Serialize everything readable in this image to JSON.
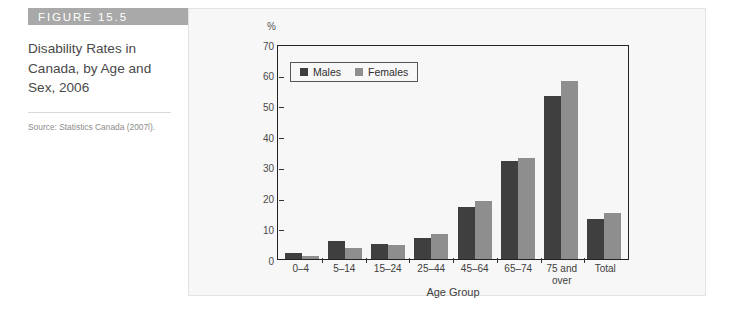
{
  "figure": {
    "band_label": "FIGURE 15.5",
    "title": "Disability Rates in Canada, by Age and Sex, 2006",
    "source": "Source: Statistics Canada (2007l).",
    "band_color": "#a9a9a9"
  },
  "chart_data": {
    "type": "bar",
    "title": "",
    "xlabel": "Age Group",
    "ylabel": "%",
    "ylim": [
      0,
      70
    ],
    "yticks": [
      0,
      10,
      20,
      30,
      40,
      50,
      60,
      70
    ],
    "grid": false,
    "legend_position": "top-left-inside",
    "categories": [
      "0–4",
      "5–14",
      "15–24",
      "25–44",
      "45–64",
      "65–74",
      "75 and over",
      "Total"
    ],
    "series": [
      {
        "name": "Males",
        "color": "#3f3f3f",
        "values": [
          2,
          6,
          5,
          7,
          17,
          32,
          53,
          13
        ]
      },
      {
        "name": "Females",
        "color": "#8e8e8e",
        "values": [
          1,
          3.5,
          4.5,
          8,
          19,
          33,
          58,
          15
        ]
      }
    ]
  }
}
